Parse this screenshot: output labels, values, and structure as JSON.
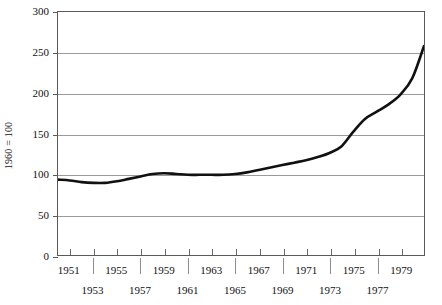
{
  "chart_data": {
    "type": "line",
    "title": "",
    "xlabel": "",
    "ylabel": "1960 = 100",
    "ylim": [
      0,
      300
    ],
    "xlim": [
      1950,
      1981
    ],
    "grid": true,
    "legend": "none",
    "y_ticks": [
      0,
      50,
      100,
      150,
      200,
      250,
      300
    ],
    "y_ticklabels": [
      "0",
      "50",
      "100",
      "150",
      "200",
      "250",
      "300"
    ],
    "x_ticklabels_top": [
      "1951",
      "1955",
      "1959",
      "1963",
      "1967",
      "1971",
      "1975",
      "1979"
    ],
    "x_ticklabels_bottom": [
      "1953",
      "1957",
      "1961",
      "1965",
      "1969",
      "1973",
      "1977"
    ],
    "x": [
      1950,
      1951,
      1952,
      1953,
      1954,
      1955,
      1956,
      1957,
      1958,
      1959,
      1960,
      1961,
      1962,
      1963,
      1964,
      1965,
      1966,
      1967,
      1968,
      1969,
      1970,
      1971,
      1972,
      1973,
      1974,
      1975,
      1976,
      1977,
      1978,
      1979,
      1980,
      1981
    ],
    "series": [
      {
        "name": "Index (1960 = 100)",
        "color": "#111111",
        "values": [
          93,
          92,
          90,
          89,
          89,
          91,
          94,
          97,
          100,
          101,
          100,
          99,
          99,
          99,
          99,
          100,
          102,
          105,
          108,
          111,
          114,
          117,
          121,
          126,
          134,
          152,
          168,
          177,
          186,
          198,
          218,
          258
        ]
      }
    ]
  },
  "axes": {
    "y_title": "1960 = 100"
  }
}
